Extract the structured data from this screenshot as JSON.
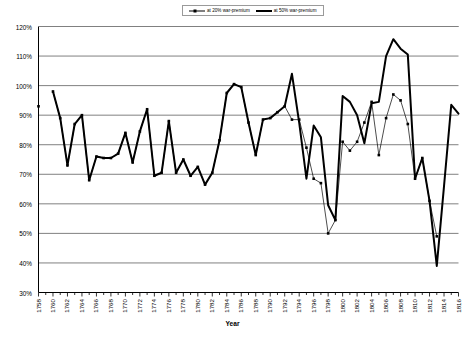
{
  "chart_data": {
    "type": "line",
    "title": "",
    "xlabel": "Year",
    "ylabel": "",
    "xlim": [
      1758,
      1816
    ],
    "ylim": [
      0.3,
      1.2
    ],
    "ytick_labels": [
      "120%",
      "110%",
      "100%",
      "90%",
      "80%",
      "70%",
      "60%",
      "50%",
      "40%",
      "30%"
    ],
    "ytick_values": [
      1.2,
      1.1,
      1.0,
      0.9,
      0.8,
      0.7,
      0.6,
      0.5,
      0.4,
      0.3
    ],
    "xtick_labels": [
      "1758",
      "1760",
      "1762",
      "1764",
      "1766",
      "1768",
      "1770",
      "1772",
      "1774",
      "1776",
      "1778",
      "1780",
      "1782",
      "1784",
      "1786",
      "1788",
      "1790",
      "1792",
      "1794",
      "1796",
      "1798",
      "1800",
      "1802",
      "1804",
      "1806",
      "1808",
      "1810",
      "1812",
      "1814",
      "1816"
    ],
    "grid": true,
    "legend_position": "top-center",
    "x": [
      1758,
      1759,
      1760,
      1761,
      1762,
      1763,
      1764,
      1765,
      1766,
      1767,
      1768,
      1769,
      1770,
      1771,
      1772,
      1773,
      1774,
      1775,
      1776,
      1777,
      1778,
      1779,
      1780,
      1781,
      1782,
      1783,
      1784,
      1785,
      1786,
      1787,
      1788,
      1789,
      1790,
      1791,
      1792,
      1793,
      1794,
      1795,
      1796,
      1797,
      1798,
      1799,
      1800,
      1801,
      1802,
      1803,
      1804,
      1805,
      1806,
      1807,
      1808,
      1809,
      1810,
      1811,
      1812,
      1813,
      1814,
      1815,
      1816
    ],
    "series": [
      {
        "name": "at 20% war-premium",
        "style": "thin-with-markers",
        "color": "#000000",
        "values": [
          0.93,
          null,
          0.98,
          0.89,
          0.73,
          0.87,
          0.9,
          0.68,
          0.76,
          0.755,
          0.755,
          0.77,
          0.84,
          0.74,
          0.845,
          0.92,
          0.695,
          0.705,
          0.88,
          0.705,
          0.75,
          0.695,
          0.725,
          0.665,
          0.705,
          0.815,
          0.975,
          1.005,
          0.995,
          0.875,
          0.765,
          0.885,
          0.89,
          0.91,
          0.93,
          0.885,
          0.885,
          0.79,
          0.685,
          0.67,
          0.5,
          0.545,
          0.81,
          0.78,
          0.81,
          0.875,
          0.945,
          0.765,
          0.89,
          0.97,
          0.95,
          0.87,
          0.685,
          0.755,
          0.61,
          0.49,
          null,
          null,
          null
        ]
      },
      {
        "name": "at 50% war-premium",
        "style": "thick",
        "color": "#000000",
        "values": [
          0.93,
          null,
          0.98,
          0.89,
          0.73,
          0.87,
          0.9,
          0.68,
          0.76,
          0.755,
          0.755,
          0.77,
          0.84,
          0.74,
          0.845,
          0.92,
          0.695,
          0.705,
          0.88,
          0.705,
          0.75,
          0.695,
          0.725,
          0.665,
          0.705,
          0.815,
          0.975,
          1.005,
          0.995,
          0.875,
          0.765,
          0.885,
          0.89,
          0.91,
          0.93,
          1.04,
          0.875,
          0.685,
          0.865,
          0.825,
          0.595,
          0.545,
          0.965,
          0.945,
          0.9,
          0.805,
          0.94,
          0.945,
          1.1,
          1.157,
          1.125,
          1.105,
          0.685,
          0.755,
          0.61,
          0.39,
          0.66,
          0.935,
          0.905
        ]
      }
    ]
  },
  "legend": {
    "entries": [
      {
        "label": "at 20% war-premium"
      },
      {
        "label": "at 50% war-premium"
      }
    ]
  },
  "axis": {
    "x_title": "Year"
  }
}
